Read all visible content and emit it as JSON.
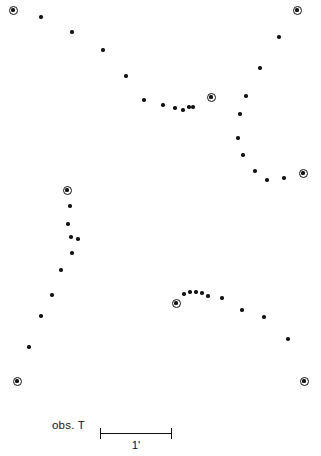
{
  "figure": {
    "kind": "astronomical-finding-chart",
    "background_color": "#ffffff",
    "marker_color": "#141414",
    "width": 321,
    "height": 456
  },
  "legend": {
    "obs_label": "obs. T",
    "scale_value": "1'",
    "scale_bar_length_px": 72
  },
  "chart_data": {
    "type": "scatter",
    "title": "",
    "subtitle": "",
    "xlabel": "",
    "ylabel": "",
    "xlim": [
      0,
      321
    ],
    "ylim": [
      456,
      0
    ],
    "grid": false,
    "legend_position": "bottom-left",
    "axes_visible": false,
    "tick_labels_x": [],
    "tick_labels_y": [],
    "annotations": [
      {
        "text": "obs. T",
        "x": 52,
        "y": 430
      },
      {
        "text": "1'",
        "x": 136,
        "y": 446
      }
    ],
    "scale_bar": {
      "label": "1'",
      "x_start": 100,
      "x_end": 172,
      "y": 429,
      "cap_height": 11
    },
    "series": [
      {
        "name": "field-sources",
        "marker": "filled-circle",
        "marker_size_px": 3.4,
        "color": "#141414",
        "points": [
          [
            41,
            17
          ],
          [
            72,
            32
          ],
          [
            103,
            50
          ],
          [
            126,
            76
          ],
          [
            144,
            100
          ],
          [
            163,
            105
          ],
          [
            175,
            108
          ],
          [
            183,
            110
          ],
          [
            189,
            107
          ],
          [
            193,
            107
          ],
          [
            246,
            96
          ],
          [
            260,
            68
          ],
          [
            279,
            37
          ],
          [
            240,
            114
          ],
          [
            238,
            138
          ],
          [
            243,
            155
          ],
          [
            255,
            171
          ],
          [
            267,
            180
          ],
          [
            284,
            178
          ],
          [
            70,
            206
          ],
          [
            68,
            224
          ],
          [
            71,
            237
          ],
          [
            78,
            239
          ],
          [
            72,
            253
          ],
          [
            61,
            270
          ],
          [
            52,
            295
          ],
          [
            41,
            316
          ],
          [
            29,
            347
          ],
          [
            184,
            294
          ],
          [
            190,
            292
          ],
          [
            196,
            292
          ],
          [
            202,
            293
          ],
          [
            208,
            296
          ],
          [
            222,
            298
          ],
          [
            242,
            310
          ],
          [
            264,
            317
          ],
          [
            288,
            339
          ]
        ]
      },
      {
        "name": "reference-objects",
        "marker": "bullseye",
        "marker_size_px": 9,
        "color": "#141414",
        "points": [
          [
            13,
            10
          ],
          [
            297,
            10
          ],
          [
            211,
            97
          ],
          [
            303,
            173
          ],
          [
            67,
            190
          ],
          [
            176,
            303
          ],
          [
            17,
            381
          ],
          [
            304,
            381
          ]
        ]
      }
    ]
  }
}
